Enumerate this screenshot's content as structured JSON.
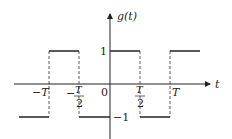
{
  "diagram": {
    "type": "square-wave signal plot",
    "function_label": "g(t)",
    "x_axis_label": "t",
    "y_ticks": [
      {
        "label": "1",
        "value": 1
      },
      {
        "label": "−1",
        "value": -1
      }
    ],
    "x_ticks": [
      {
        "label": "−T",
        "value": "-T"
      },
      {
        "label": "−T/2",
        "numerator": "T",
        "denominator": "2",
        "sign": "−",
        "value": "-T/2"
      },
      {
        "label": "0",
        "value": "0"
      },
      {
        "label": "T/2",
        "numerator": "T",
        "denominator": "2",
        "value": "T/2"
      },
      {
        "label": "T",
        "value": "T"
      }
    ],
    "segments": [
      {
        "from": "<-T",
        "to": "-T",
        "level": -1
      },
      {
        "from": "-T",
        "to": "-T/2",
        "level": 1
      },
      {
        "from": "-T/2",
        "to": "0",
        "level": -1
      },
      {
        "from": "0",
        "to": "T/2",
        "level": 1
      },
      {
        "from": "T/2",
        "to": "T",
        "level": -1
      },
      {
        "from": "T",
        "to": ">T",
        "level": 1
      }
    ],
    "colors": {
      "line": "#222222",
      "background": "#ffffff"
    }
  }
}
